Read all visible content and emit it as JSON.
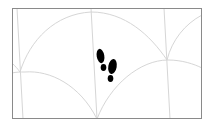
{
  "illustration": {
    "description": "Framed tile pattern of overlapping arcs with footprints icon",
    "frame": {
      "x": 12,
      "y": 8,
      "width": 190,
      "height": 111,
      "stroke": "#8a8a8a"
    },
    "line_color": "#d4d4d4",
    "icon": {
      "name": "footprints-icon",
      "color": "#000000"
    }
  },
  "colors": {
    "background": "#ffffff",
    "frame": "#8a8a8a",
    "pattern_lines": "#d4d4d4",
    "footprints": "#000000"
  }
}
